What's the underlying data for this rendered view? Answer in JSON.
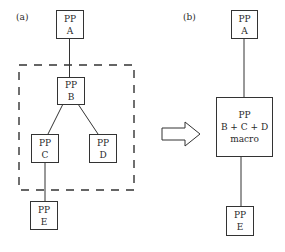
{
  "panels": {
    "a": {
      "label": "(a)",
      "nodes": {
        "A": {
          "line1": "PP",
          "line2": "A"
        },
        "B": {
          "line1": "PP",
          "line2": "B"
        },
        "C": {
          "line1": "PP",
          "line2": "C"
        },
        "D": {
          "line1": "PP",
          "line2": "D"
        },
        "E": {
          "line1": "PP",
          "line2": "E"
        }
      },
      "group": "dashed boundary around B, C, D"
    },
    "b": {
      "label": "(b)",
      "nodes": {
        "A": {
          "line1": "PP",
          "line2": "A"
        },
        "macro": {
          "line1": "PP",
          "line2": "B + C + D",
          "line3": "macro"
        },
        "E": {
          "line1": "PP",
          "line2": "E"
        }
      }
    }
  },
  "transform_arrow": "right-arrow",
  "colors": {
    "stroke": "#333333",
    "background": "#ffffff"
  }
}
